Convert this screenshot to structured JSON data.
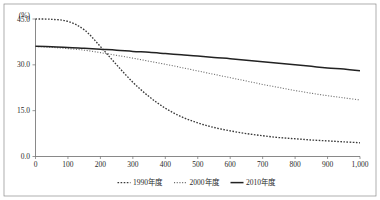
{
  "chart_data": {
    "type": "line",
    "title": "",
    "subtitle": "",
    "xlabel": "",
    "ylabel": "",
    "unit_label": "(%)",
    "xlim": [
      0,
      1000
    ],
    "ylim": [
      0,
      45
    ],
    "grid": false,
    "legend_position": "bottom-center",
    "x_ticks": [
      0,
      100,
      200,
      300,
      400,
      500,
      600,
      700,
      800,
      900,
      1000
    ],
    "x_tick_labels": [
      "0",
      "100",
      "200",
      "300",
      "400",
      "500",
      "600",
      "700",
      "800",
      "900",
      "1,000"
    ],
    "y_ticks": [
      0,
      15,
      30,
      45
    ],
    "y_tick_labels": [
      "0.0",
      "15.0",
      "30.0",
      "45.0"
    ],
    "x": [
      0,
      50,
      100,
      150,
      200,
      250,
      300,
      350,
      400,
      450,
      500,
      550,
      600,
      650,
      700,
      750,
      800,
      850,
      900,
      950,
      1000
    ],
    "series": [
      {
        "name": "1990年度",
        "style": "dotted-dense",
        "color": "#3a3a3a",
        "values": [
          45.0,
          44.9,
          44.2,
          41.5,
          36.0,
          30.0,
          24.3,
          19.6,
          15.8,
          13.0,
          11.0,
          9.5,
          8.4,
          7.5,
          6.8,
          6.2,
          5.8,
          5.4,
          5.1,
          4.8,
          4.5
        ]
      },
      {
        "name": "2000年度",
        "style": "dotted-fine",
        "color": "#6e6e6e",
        "values": [
          36.0,
          35.7,
          35.3,
          34.8,
          34.0,
          33.1,
          32.2,
          31.2,
          30.2,
          29.1,
          28.0,
          26.9,
          25.8,
          24.7,
          23.6,
          22.6,
          21.6,
          20.7,
          19.9,
          19.2,
          18.5
        ]
      },
      {
        "name": "2010年度",
        "style": "solid",
        "color": "#222222",
        "values": [
          36.1,
          35.9,
          35.7,
          35.4,
          35.1,
          34.8,
          34.4,
          34.1,
          33.7,
          33.3,
          32.9,
          32.4,
          32.0,
          31.5,
          31.0,
          30.5,
          30.0,
          29.5,
          29.0,
          28.6,
          28.1
        ]
      }
    ]
  },
  "legend": {
    "items": [
      {
        "label": "1990年度",
        "swatch": "dotted-dense-swatch"
      },
      {
        "label": "2000年度",
        "swatch": "dotted-fine-swatch"
      },
      {
        "label": "2010年度",
        "swatch": "solid-swatch"
      }
    ]
  }
}
